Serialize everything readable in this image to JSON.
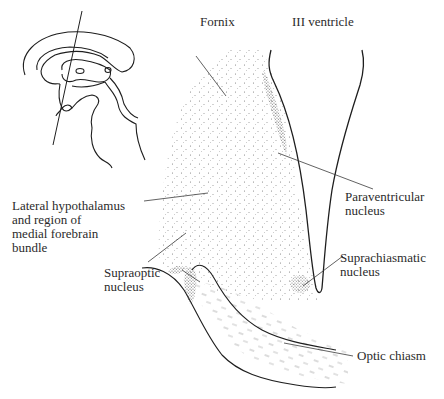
{
  "figure": {
    "type": "anatomical-diagram",
    "inset": "Sagittal brain outline with line indicating plane of section"
  },
  "labels": {
    "fornix": "Fornix",
    "third_ventricle": "III ventricle",
    "paraventricular": [
      "Paraventricular",
      "nucleus"
    ],
    "lateral_hypothalamus": [
      "Lateral hypothalamus",
      "and region of",
      "medial forebrain",
      "bundle"
    ],
    "suprachiasmatic": [
      "Suprachiasmatic",
      "nucleus"
    ],
    "supraoptic": [
      "Supraoptic",
      "nucleus"
    ],
    "optic_chiasm": "Optic chiasm"
  },
  "colors": {
    "line": "#1e1e1e",
    "leader": "#3a3a3a",
    "stipple": "#6a6a6a",
    "background": "#ffffff"
  }
}
